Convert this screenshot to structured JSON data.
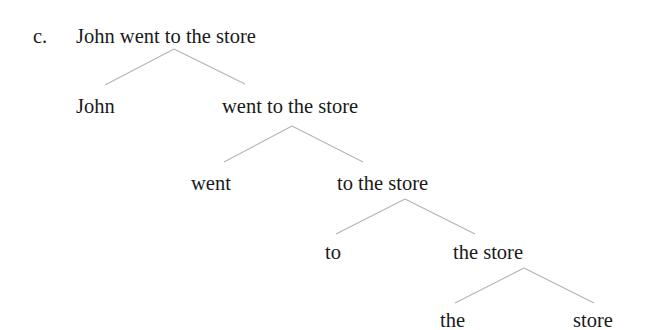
{
  "example_label": "c.",
  "tree": {
    "root": "John went to the store",
    "level1": {
      "left": "John",
      "right": "went to the store"
    },
    "level2": {
      "left": "went",
      "right": "to the store"
    },
    "level3": {
      "left": "to",
      "right": "the store"
    },
    "level4": {
      "left": "the",
      "right": "store"
    }
  },
  "colors": {
    "text": "#1a1a1a",
    "edges": "#b4b4b4",
    "background": "#ffffff"
  }
}
